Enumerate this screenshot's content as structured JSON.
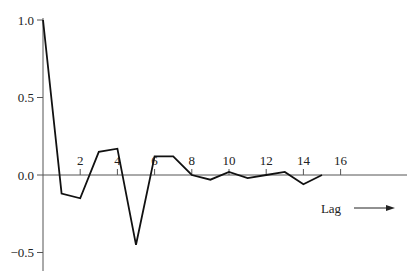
{
  "chart_data": {
    "type": "line",
    "title": "",
    "xlabel": "Lag",
    "ylabel": "",
    "x": [
      0,
      1,
      2,
      3,
      4,
      5,
      6,
      7,
      8,
      9,
      10,
      11,
      12,
      13,
      14,
      15
    ],
    "series": [
      {
        "name": "autocorrelation",
        "values": [
          1.0,
          -0.12,
          -0.15,
          0.15,
          0.17,
          -0.45,
          0.12,
          0.12,
          0.0,
          -0.03,
          0.02,
          -0.02,
          0.0,
          0.02,
          -0.06,
          0.0
        ]
      }
    ],
    "xticks": [
      2,
      4,
      6,
      8,
      10,
      12,
      14,
      16
    ],
    "xtick_labels": [
      "2",
      "4",
      "6",
      "8",
      "10",
      "12",
      "14",
      "16"
    ],
    "yticks": [
      1.0,
      0.5,
      0.0,
      -0.5
    ],
    "ytick_labels": [
      "1.0",
      "0.5",
      "0.0",
      "−0.5"
    ],
    "xlim": [
      0,
      19.7
    ],
    "ylim": [
      -0.6,
      1.0
    ],
    "grid": false,
    "legend": null,
    "annotations": [
      {
        "text": "Lag",
        "arrow": "right"
      }
    ]
  }
}
